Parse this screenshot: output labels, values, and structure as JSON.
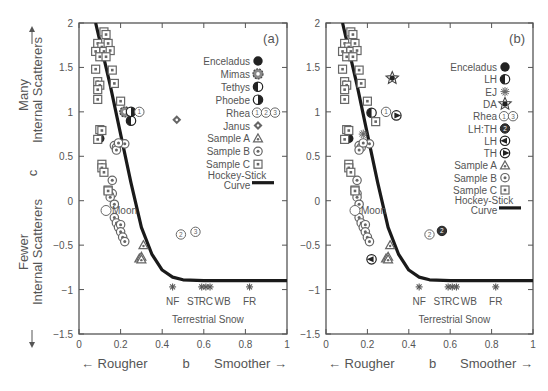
{
  "chart_data": [
    {
      "panel": "(a)",
      "type": "scatter",
      "xlabel": "b",
      "ylabel": "c",
      "xlabel_left": "← Rougher",
      "xlabel_right": "Smoother →",
      "ylabel_top": "Many Internal Scatterers",
      "ylabel_bottom": "Fewer Internal Scatterers",
      "xlim": [
        0,
        1
      ],
      "ylim": [
        -1.5,
        2
      ],
      "xticks": [
        "0",
        "0.2",
        "0.4",
        "0.6",
        "0.8",
        "1"
      ],
      "yticks": [
        "-1.5",
        "-1",
        "-0.5",
        "0",
        "0.5",
        "1",
        "1.5",
        "2"
      ],
      "annotations": [
        "Moon",
        "NF",
        "ST",
        "RC",
        "WB",
        "FR",
        "Terrestrial Snow"
      ],
      "legend": [
        "Enceladus",
        "Mimas",
        "Tethys",
        "Phoebe",
        "Rhea ①②③",
        "Janus",
        "Sample A",
        "Sample B",
        "Sample C",
        "Hockey-Stick Curve"
      ],
      "series": [
        {
          "name": "Enceladus",
          "points": [
            [
              0.1,
              0.7
            ]
          ]
        },
        {
          "name": "Mimas",
          "points": [
            [
              0.22,
              1.0
            ]
          ]
        },
        {
          "name": "Tethys",
          "points": [
            [
              0.25,
              0.9
            ]
          ]
        },
        {
          "name": "Phoebe",
          "points": [
            [
              0.25,
              1.0
            ]
          ]
        },
        {
          "name": "Rhea",
          "points": [
            [
              0.29,
              1.0
            ],
            [
              0.49,
              -0.38
            ],
            [
              0.56,
              -0.35
            ]
          ]
        },
        {
          "name": "Janus",
          "points": [
            [
              0.47,
              0.91
            ]
          ]
        },
        {
          "name": "Sample A",
          "points": [
            [
              0.31,
              -0.5
            ],
            [
              0.29,
              -0.65
            ],
            [
              0.3,
              -0.63
            ],
            [
              0.3,
              -0.66
            ]
          ]
        },
        {
          "name": "Sample B",
          "points": [
            [
              0.17,
              0.62
            ],
            [
              0.18,
              0.6
            ],
            [
              0.18,
              0.57
            ],
            [
              0.22,
              0.64
            ],
            [
              0.19,
              0.65
            ],
            [
              0.16,
              0.23
            ],
            [
              0.16,
              0.08
            ],
            [
              0.15,
              0.04
            ],
            [
              0.17,
              -0.04
            ],
            [
              0.17,
              -0.19
            ],
            [
              0.18,
              -0.25
            ],
            [
              0.19,
              -0.3
            ],
            [
              0.2,
              -0.27
            ],
            [
              0.2,
              -0.35
            ],
            [
              0.21,
              -0.41
            ],
            [
              0.22,
              -0.46
            ]
          ]
        },
        {
          "name": "Sample C",
          "points": [
            [
              0.12,
              1.9
            ],
            [
              0.13,
              1.87
            ],
            [
              0.09,
              1.77
            ],
            [
              0.11,
              1.73
            ],
            [
              0.14,
              1.77
            ],
            [
              0.08,
              1.68
            ],
            [
              0.12,
              1.68
            ],
            [
              0.15,
              1.69
            ],
            [
              0.1,
              1.62
            ],
            [
              0.13,
              1.62
            ],
            [
              0.08,
              1.48
            ],
            [
              0.16,
              1.47
            ],
            [
              0.09,
              1.34
            ],
            [
              0.1,
              1.3
            ],
            [
              0.09,
              1.25
            ],
            [
              0.17,
              1.32
            ],
            [
              0.09,
              1.14
            ],
            [
              0.2,
              1.12
            ],
            [
              0.1,
              0.8
            ],
            [
              0.11,
              0.79
            ],
            [
              0.09,
              0.69
            ],
            [
              0.11,
              0.41
            ],
            [
              0.11,
              0.37
            ],
            [
              0.12,
              0.32
            ],
            [
              0.14,
              0.12
            ],
            [
              0.14,
              0.11
            ]
          ]
        },
        {
          "name": "Moon",
          "points": [
            [
              0.13,
              -0.11
            ]
          ]
        },
        {
          "name": "Terrestrial Snow",
          "points": [
            [
              0.45,
              -0.97
            ],
            [
              0.59,
              -0.97
            ],
            [
              0.61,
              -0.97
            ],
            [
              0.63,
              -0.97
            ],
            [
              0.82,
              -0.97
            ]
          ],
          "labels": [
            "NF",
            "ST",
            "RC",
            "WB",
            "FR"
          ]
        }
      ],
      "curve": {
        "name": "Hockey-Stick Curve",
        "points": [
          [
            0.08,
            2.0
          ],
          [
            0.15,
            1.3
          ],
          [
            0.2,
            0.75
          ],
          [
            0.25,
            0.2
          ],
          [
            0.3,
            -0.3
          ],
          [
            0.35,
            -0.6
          ],
          [
            0.4,
            -0.78
          ],
          [
            0.45,
            -0.86
          ],
          [
            0.5,
            -0.89
          ],
          [
            0.6,
            -0.9
          ],
          [
            1.0,
            -0.9
          ]
        ]
      }
    },
    {
      "panel": "(b)",
      "type": "scatter",
      "xlabel": "b",
      "ylabel": "c",
      "xlabel_left": "← Rougher",
      "xlabel_right": "Smoother →",
      "xlim": [
        0,
        1
      ],
      "ylim": [
        -1.5,
        2
      ],
      "xticks": [
        "0",
        "0.2",
        "0.4",
        "0.6",
        "0.8",
        "1"
      ],
      "yticks": [
        "-1.5",
        "-1",
        "-0.5",
        "0",
        "0.5",
        "1",
        "1.5",
        "2"
      ],
      "annotations": [
        "Moon",
        "NF",
        "ST",
        "RC",
        "WB",
        "FR",
        "Terrestrial Snow"
      ],
      "legend": [
        "Enceladus",
        "LH",
        "EJ",
        "DA",
        "Rhea ①③",
        "LH:TH",
        "LH",
        "TH",
        "Sample A",
        "Sample B",
        "Sample C",
        "Hockey-Stick Curve"
      ],
      "series": [
        {
          "name": "Enceladus",
          "points": [
            [
              0.11,
              0.7
            ]
          ]
        },
        {
          "name": "LH (half)",
          "points": [
            [
              0.22,
              0.99
            ]
          ]
        },
        {
          "name": "EJ",
          "points": [
            [
              0.18,
              0.75
            ]
          ]
        },
        {
          "name": "DA",
          "points": [
            [
              0.32,
              1.38
            ]
          ]
        },
        {
          "name": "Rhea",
          "points": [
            [
              0.29,
              1.0
            ],
            [
              0.5,
              -0.38
            ]
          ]
        },
        {
          "name": "LH:TH",
          "points": [
            [
              0.56,
              -0.34
            ]
          ]
        },
        {
          "name": "LH (left)",
          "points": [
            [
              0.22,
              -0.66
            ]
          ]
        },
        {
          "name": "TH",
          "points": [
            [
              0.34,
              0.96
            ]
          ]
        },
        {
          "name": "Sample A",
          "points": [
            [
              0.31,
              -0.5
            ],
            [
              0.29,
              -0.65
            ],
            [
              0.3,
              -0.63
            ],
            [
              0.3,
              -0.66
            ]
          ]
        },
        {
          "name": "Sample B",
          "points": [
            [
              0.16,
              0.62
            ],
            [
              0.17,
              0.6
            ],
            [
              0.16,
              0.57
            ],
            [
              0.21,
              0.64
            ],
            [
              0.18,
              0.65
            ],
            [
              0.15,
              0.23
            ],
            [
              0.15,
              0.08
            ],
            [
              0.15,
              0.04
            ],
            [
              0.16,
              -0.04
            ],
            [
              0.16,
              -0.19
            ],
            [
              0.17,
              -0.25
            ],
            [
              0.18,
              -0.3
            ],
            [
              0.19,
              -0.27
            ],
            [
              0.19,
              -0.35
            ],
            [
              0.2,
              -0.41
            ],
            [
              0.21,
              -0.46
            ]
          ]
        },
        {
          "name": "Sample C",
          "points": [
            [
              0.12,
              1.9
            ],
            [
              0.13,
              1.87
            ],
            [
              0.09,
              1.77
            ],
            [
              0.11,
              1.73
            ],
            [
              0.14,
              1.77
            ],
            [
              0.08,
              1.68
            ],
            [
              0.12,
              1.68
            ],
            [
              0.15,
              1.69
            ],
            [
              0.1,
              1.62
            ],
            [
              0.13,
              1.62
            ],
            [
              0.08,
              1.48
            ],
            [
              0.16,
              1.47
            ],
            [
              0.09,
              1.34
            ],
            [
              0.1,
              1.3
            ],
            [
              0.09,
              1.25
            ],
            [
              0.17,
              1.32
            ],
            [
              0.09,
              1.14
            ],
            [
              0.2,
              1.12
            ],
            [
              0.24,
              0.89
            ],
            [
              0.1,
              0.8
            ],
            [
              0.11,
              0.79
            ],
            [
              0.09,
              0.69
            ],
            [
              0.11,
              0.41
            ],
            [
              0.11,
              0.37
            ],
            [
              0.12,
              0.32
            ],
            [
              0.14,
              0.12
            ],
            [
              0.14,
              0.11
            ]
          ]
        },
        {
          "name": "Moon",
          "points": [
            [
              0.14,
              -0.11
            ]
          ]
        },
        {
          "name": "Terrestrial Snow",
          "points": [
            [
              0.45,
              -0.97
            ],
            [
              0.59,
              -0.97
            ],
            [
              0.61,
              -0.97
            ],
            [
              0.63,
              -0.97
            ],
            [
              0.82,
              -0.97
            ]
          ],
          "labels": [
            "NF",
            "ST",
            "RC",
            "WB",
            "FR"
          ]
        }
      ],
      "curve": {
        "name": "Hockey-Stick Curve",
        "points": [
          [
            0.08,
            2.0
          ],
          [
            0.15,
            1.3
          ],
          [
            0.2,
            0.75
          ],
          [
            0.25,
            0.2
          ],
          [
            0.3,
            -0.3
          ],
          [
            0.35,
            -0.6
          ],
          [
            0.4,
            -0.78
          ],
          [
            0.45,
            -0.86
          ],
          [
            0.5,
            -0.89
          ],
          [
            0.6,
            -0.9
          ],
          [
            1.0,
            -0.9
          ]
        ]
      }
    }
  ],
  "labels": {
    "panel_a": "(a)",
    "panel_b": "(b)",
    "y_many": "Many",
    "y_internal_top": "Internal Scatterers",
    "y_c": "c",
    "y_fewer": "Fewer",
    "y_internal_bottom": "Internal Scatterers",
    "x_rougher": "← Rougher",
    "x_b": "b",
    "x_smoother": "Smoother →",
    "moon": "Moon",
    "terrestrial_snow": "Terrestrial Snow",
    "snow_labels": [
      "NF",
      "ST",
      "RC",
      "WB",
      "FR"
    ],
    "legend_a": [
      "Enceladus",
      "Mimas",
      "Tethys",
      "Phoebe",
      "Rhea",
      "Janus",
      "Sample A",
      "Sample B",
      "Sample C",
      "Hockey-Stick",
      "Curve"
    ],
    "legend_b": [
      "Enceladus",
      "LH",
      "EJ",
      "DA",
      "Rhea",
      "LH:TH",
      "LH",
      "TH",
      "Sample A",
      "Sample B",
      "Sample C",
      "Hockey-Stick",
      "Curve"
    ]
  },
  "colors": {
    "axis": "#555555",
    "curve": "#1a1a1a",
    "marker": "#666666",
    "text": "#555555"
  }
}
